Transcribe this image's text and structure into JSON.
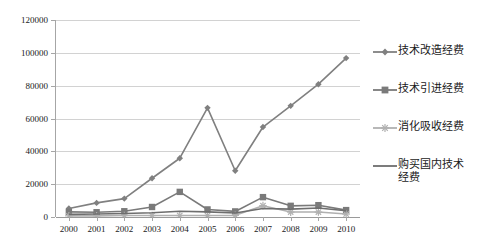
{
  "chart_data": {
    "type": "line",
    "title": "",
    "xlabel": "",
    "ylabel": "",
    "categories": [
      "2000",
      "2001",
      "2002",
      "2003",
      "2004",
      "2005",
      "2006",
      "2007",
      "2008",
      "2009",
      "2010"
    ],
    "ylim": [
      0,
      120000
    ],
    "ytick_labels": [
      "0",
      "20000",
      "40000",
      "60000",
      "80000",
      "100000",
      "120000"
    ],
    "ytick_values": [
      0,
      20000,
      40000,
      60000,
      80000,
      100000,
      120000
    ],
    "grid": true,
    "legend_position": "right",
    "series": [
      {
        "name": "技术改造经费",
        "marker": "diamond",
        "color": "#808080",
        "values": [
          5200,
          8600,
          11200,
          23600,
          35800,
          66500,
          28200,
          54800,
          67700,
          80900,
          96800
        ]
      },
      {
        "name": "技术引进经费",
        "marker": "square",
        "color": "#7a7a7a",
        "values": [
          3100,
          2900,
          3500,
          6100,
          15300,
          4600,
          3400,
          12100,
          6800,
          7200,
          4200
        ]
      },
      {
        "name": "消化吸收经费",
        "marker": "asterisk",
        "color": "#b0b0b0",
        "values": [
          700,
          700,
          900,
          900,
          900,
          900,
          1000,
          6900,
          3000,
          3000,
          1800
        ]
      },
      {
        "name": "购买国内技术经费",
        "marker": "line",
        "color": "#6e6e6e",
        "values": [
          1600,
          1800,
          2100,
          2600,
          3500,
          3100,
          2400,
          5200,
          4800,
          5500,
          3800
        ]
      }
    ]
  },
  "legend": {
    "items": [
      {
        "label": "技术改造经费",
        "marker": "diamond"
      },
      {
        "label": "技术引进经费",
        "marker": "square"
      },
      {
        "label": "消化吸收经费",
        "marker": "asterisk"
      },
      {
        "label": "购买国内技术\n经费",
        "marker": "line"
      }
    ]
  },
  "axis": {
    "y_labels": [
      "120000",
      "100000",
      "80000",
      "60000",
      "40000",
      "20000",
      "0"
    ],
    "x_labels": [
      "2000",
      "2001",
      "2002",
      "2003",
      "2004",
      "2005",
      "2006",
      "2007",
      "2008",
      "2009",
      "2010"
    ]
  }
}
